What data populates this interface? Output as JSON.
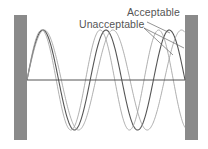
{
  "diagram": {
    "labels": {
      "acceptable": "Acceptable",
      "unacceptable": "Unacceptable"
    },
    "walls": {
      "left": {
        "x": 14,
        "width": 13
      },
      "right": {
        "x": 185,
        "width": 13
      },
      "top": 15,
      "bottom": 140,
      "color": "#8a8a8a"
    },
    "axis": {
      "y": 80,
      "x1": 27,
      "x2": 185,
      "color": "#555555"
    },
    "waves": [
      {
        "name": "acceptable",
        "half_wavelengths": 5,
        "color": "#555555"
      },
      {
        "name": "unacceptable-short",
        "half_wavelengths": 5.4,
        "color": "#9a9a9a"
      },
      {
        "name": "unacceptable-long",
        "half_wavelengths": 4.6,
        "color": "#9a9a9a"
      }
    ],
    "amplitude": 50
  }
}
